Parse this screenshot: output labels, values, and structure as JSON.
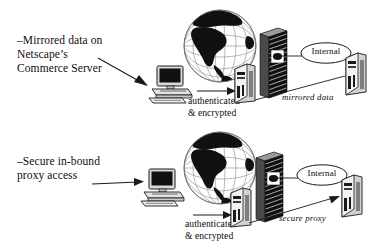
{
  "diagram": {
    "colors": {
      "ink": "#0d0d0d",
      "line": "#1a1a1a",
      "firewall_dark": "#151515",
      "globe_land": "#111111",
      "paper": "#ffffff",
      "device_gray": "#b9b9b9"
    },
    "rows": [
      {
        "id": "row-mirrored",
        "callout": "–Mirrored data on\nNetscape’s\nCommerce Server",
        "link_label": "authenticated\n& encrypted",
        "zone_label": "Internal",
        "flow_label": "mirrored data",
        "icons": {
          "globe": "globe-icon",
          "workstation": "workstation-icon",
          "front_server": "server-tower-icon",
          "firewall": "firewall-wall-icon",
          "back_server": "server-tower-icon"
        }
      },
      {
        "id": "row-proxy",
        "callout": "–Secure in-bound\nproxy access",
        "link_label": "authenticated\n& encrypted",
        "zone_label": "Internal",
        "flow_label": "secure proxy",
        "icons": {
          "globe": "globe-icon",
          "workstation": "workstation-icon",
          "front_server": "server-tower-icon",
          "firewall": "firewall-wall-icon",
          "back_server": "server-tower-icon"
        }
      }
    ]
  }
}
